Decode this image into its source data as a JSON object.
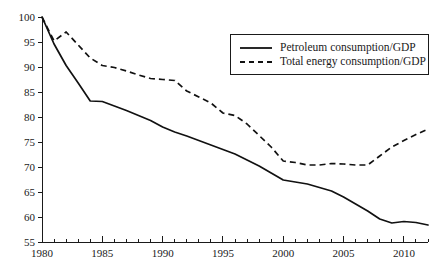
{
  "chart_data": {
    "type": "line",
    "title": "",
    "subtitle": "",
    "xlabel": "",
    "ylabel": "",
    "xlim": [
      1980,
      2012
    ],
    "ylim": [
      55,
      100
    ],
    "grid": false,
    "legend_position": "top-right",
    "x_ticks_major": [
      1980,
      1985,
      1990,
      1995,
      2000,
      2005,
      2010
    ],
    "x_tick_labels": [
      "1980",
      "1985",
      "1990",
      "1995",
      "2000",
      "2005",
      "2010"
    ],
    "x_tick_minor_step": 1,
    "y_ticks": [
      55,
      60,
      65,
      70,
      75,
      80,
      85,
      90,
      95,
      100
    ],
    "y_tick_labels": [
      "55",
      "60",
      "65",
      "70",
      "75",
      "80",
      "85",
      "90",
      "95",
      "100"
    ],
    "x": [
      1980,
      1981,
      1982,
      1983,
      1984,
      1985,
      1986,
      1987,
      1988,
      1989,
      1990,
      1991,
      1992,
      1993,
      1994,
      1995,
      1996,
      1997,
      1998,
      1999,
      2000,
      2001,
      2002,
      2003,
      2004,
      2005,
      2006,
      2007,
      2008,
      2009,
      2010,
      2011,
      2012
    ],
    "series": [
      {
        "name": "Petroleum consumption/GDP",
        "style": "solid",
        "color": "#111111",
        "values": [
          100.0,
          94.6,
          90.3,
          86.8,
          83.2,
          83.1,
          82.2,
          81.3,
          80.3,
          79.3,
          78.0,
          77.0,
          76.2,
          75.3,
          74.4,
          73.5,
          72.6,
          71.4,
          70.2,
          68.8,
          67.4,
          67.0,
          66.6,
          65.9,
          65.2,
          64.0,
          62.6,
          61.2,
          59.6,
          58.8,
          59.1,
          58.9,
          58.4
        ]
      },
      {
        "name": "Total energy consumption/GDP",
        "style": "dashed",
        "color": "#111111",
        "values": [
          100.0,
          95.2,
          97.0,
          94.4,
          91.8,
          90.3,
          89.9,
          89.2,
          88.4,
          87.7,
          87.5,
          87.3,
          85.2,
          84.0,
          82.8,
          80.8,
          80.3,
          78.6,
          76.3,
          74.0,
          71.2,
          70.9,
          70.4,
          70.4,
          70.7,
          70.6,
          70.4,
          70.4,
          72.2,
          74.0,
          75.3,
          76.5,
          77.6
        ]
      }
    ],
    "legend": [
      {
        "label": "Petroleum consumption/GDP",
        "style": "solid"
      },
      {
        "label": "Total energy consumption/GDP",
        "style": "dashed"
      }
    ]
  },
  "plot_geometry": {
    "left": 42,
    "right": 428,
    "top": 17,
    "bottom": 242
  }
}
